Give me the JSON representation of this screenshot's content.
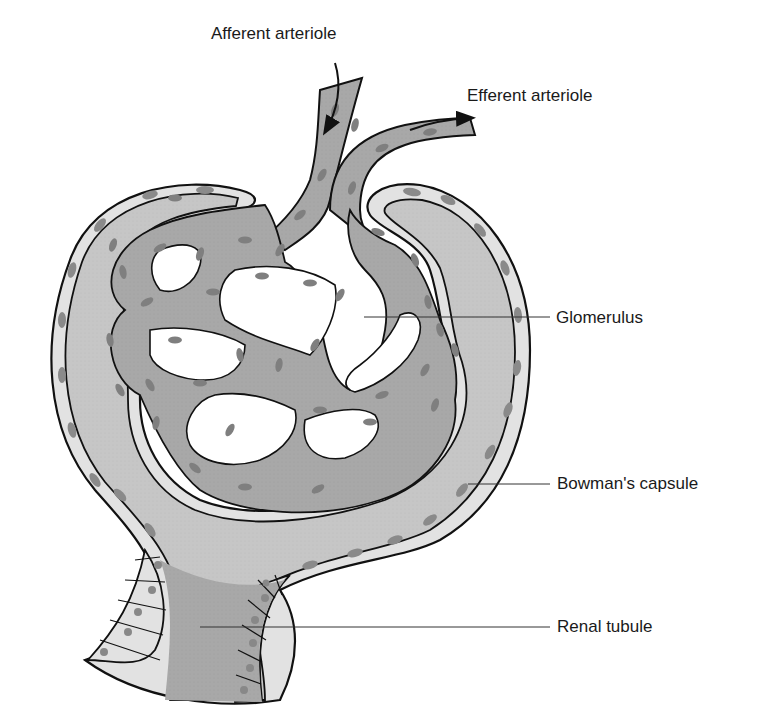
{
  "diagram": {
    "labels": {
      "afferent": "Afferent arteriole",
      "efferent": "Efferent arteriole",
      "glomerulus": "Glomerulus",
      "bowman": "Bowman's capsule",
      "tubule": "Renal tubule"
    },
    "colors": {
      "capsule_fill": "#c8c8c8",
      "capillary_fill": "#a9a9a9",
      "nuclei": "#808080",
      "outline": "#111111",
      "background": "#ffffff",
      "leader_line": "#333333"
    }
  }
}
